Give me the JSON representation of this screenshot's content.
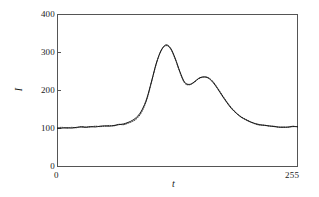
{
  "chart_data": {
    "type": "line",
    "title": "",
    "subtitle": "",
    "xlabel": "t",
    "ylabel": "I",
    "xlim": [
      0,
      255
    ],
    "ylim": [
      0,
      400
    ],
    "xticks": [
      0,
      255
    ],
    "xticklabels": [
      "0",
      "255"
    ],
    "yticks": [
      0,
      100,
      200,
      300,
      400
    ],
    "yticklabels": [
      "0",
      "100",
      "200",
      "300",
      "400"
    ],
    "grid": false,
    "legend": null,
    "legend_position": "none",
    "frame": "box",
    "annotations": [],
    "series": [
      {
        "name": "solid-curve",
        "style": "solid",
        "color": "#1a1a1a",
        "x": [
          0,
          5,
          10,
          15,
          20,
          25,
          30,
          35,
          40,
          45,
          50,
          55,
          60,
          65,
          70,
          75,
          80,
          85,
          90,
          95,
          100,
          105,
          110,
          115,
          120,
          125,
          130,
          135,
          140,
          145,
          150,
          155,
          160,
          165,
          170,
          175,
          180,
          185,
          190,
          195,
          200,
          205,
          210,
          215,
          220,
          225,
          230,
          235,
          240,
          245,
          250,
          255
        ],
        "values": [
          100,
          101,
          102,
          101,
          103,
          104,
          103,
          105,
          104,
          106,
          107,
          106,
          108,
          110,
          112,
          116,
          122,
          132,
          150,
          180,
          225,
          272,
          305,
          320,
          312,
          285,
          250,
          222,
          216,
          222,
          232,
          236,
          233,
          222,
          205,
          186,
          168,
          152,
          140,
          130,
          123,
          117,
          113,
          110,
          108,
          107,
          105,
          104,
          103,
          104,
          105,
          105
        ]
      },
      {
        "name": "dotted-curve",
        "style": "dotted",
        "color": "#1a1a1a",
        "x": [
          0,
          5,
          10,
          15,
          20,
          25,
          30,
          35,
          40,
          45,
          50,
          55,
          60,
          65,
          70,
          75,
          80,
          85,
          90,
          95,
          100,
          105,
          110,
          115,
          120,
          125,
          130,
          135,
          140,
          145,
          150,
          155,
          160,
          165,
          170,
          175,
          180,
          185,
          190,
          195,
          200,
          205,
          210,
          215,
          220,
          225,
          230,
          235,
          240,
          245,
          250,
          255
        ],
        "values": [
          102,
          103,
          101,
          103,
          102,
          105,
          104,
          104,
          106,
          105,
          106,
          108,
          107,
          111,
          110,
          114,
          119,
          128,
          146,
          177,
          223,
          270,
          304,
          318,
          310,
          283,
          248,
          220,
          215,
          221,
          231,
          235,
          234,
          224,
          207,
          188,
          170,
          154,
          141,
          131,
          124,
          118,
          112,
          109,
          109,
          106,
          106,
          103,
          104,
          103,
          106,
          104
        ]
      }
    ]
  },
  "axis": {
    "x_origin_label": "0",
    "x_end_label": "255",
    "y_0": "0",
    "y_100": "100",
    "y_200": "200",
    "y_300": "300",
    "y_400": "400",
    "x_title": "t",
    "y_title": "I"
  },
  "colors": {
    "curve": "#1a1a1a",
    "frame": "#555555",
    "text": "#1a1a1a",
    "background": "#ffffff"
  }
}
